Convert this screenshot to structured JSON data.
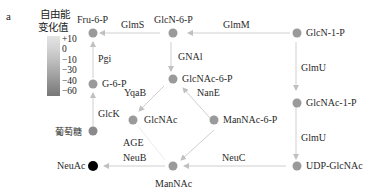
{
  "panel_label": "a",
  "legend": {
    "title_line1": "自由能",
    "title_line2": "变化值",
    "ticks": [
      "+10",
      "0",
      "−10",
      "−30",
      "−40",
      "−60"
    ]
  },
  "nodes": {
    "fru6p": "Fru-6-P",
    "glcn6p": "GlcN-6-P",
    "glcn1p": "GlcN-1-P",
    "g6p": "G-6-P",
    "glcnac6p": "GlcNAc-6-P",
    "glcnac1p": "GlcNAc-1-P",
    "glucose": "葡萄糖",
    "glcnac": "GlcNAc",
    "mannac6p": "ManNAc-6-P",
    "neuac": "NeuAc",
    "mannac": "ManNAc",
    "udpglcnac": "UDP-GlcNAc"
  },
  "enzymes": {
    "glms": "GlmS",
    "glmm": "GlmM",
    "pgi": "Pgi",
    "gnai": "GNAl",
    "glmu1": "GlmU",
    "yqab": "YqaB",
    "nane": "NanE",
    "glck": "GlcK",
    "glmu2": "GlmU",
    "age": "AGE",
    "neub": "NeuB",
    "neuc": "NeuC"
  },
  "colors": {
    "node_default": "#9a9a9a",
    "node_neuac": "#000000",
    "edge": "#c8c8c8"
  }
}
